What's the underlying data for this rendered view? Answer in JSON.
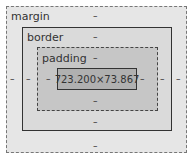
{
  "box_model": {
    "margin": {
      "label": "margin",
      "top": "–",
      "right": "–",
      "bottom": "–",
      "left": "–"
    },
    "border": {
      "label": "border",
      "top": "–",
      "right": "–",
      "bottom": "–",
      "left": "–"
    },
    "padding": {
      "label": "padding",
      "top": "–",
      "right": "–",
      "bottom": "–",
      "left": "–"
    },
    "content": {
      "size": "723.200×73.867"
    }
  },
  "colors": {
    "margin": "#e6e6e6",
    "border": "#dadada",
    "padding": "#c6c6c6",
    "content": "#b0b0b0"
  }
}
